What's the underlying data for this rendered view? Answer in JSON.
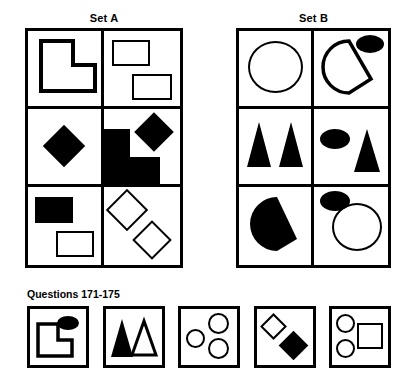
{
  "sets": [
    {
      "id": "set-a",
      "label": "Set A",
      "cells": [
        {
          "name": "cell-a1",
          "desc": "outlined L-shape",
          "shapes": [
            "l-shape-outline"
          ]
        },
        {
          "name": "cell-a2",
          "desc": "two outlined rectangles",
          "shapes": [
            "rectangle-outline",
            "rectangle-outline"
          ]
        },
        {
          "name": "cell-a3",
          "desc": "black diamond",
          "shapes": [
            "diamond-filled"
          ]
        },
        {
          "name": "cell-a4",
          "desc": "black L-shape and black diamond",
          "shapes": [
            "l-shape-filled",
            "diamond-filled"
          ]
        },
        {
          "name": "cell-a5",
          "desc": "black rectangle and outlined rectangle",
          "shapes": [
            "rectangle-filled",
            "rectangle-outline"
          ]
        },
        {
          "name": "cell-a6",
          "desc": "two outlined diamonds",
          "shapes": [
            "diamond-outline",
            "diamond-outline"
          ]
        }
      ]
    },
    {
      "id": "set-b",
      "label": "Set B",
      "cells": [
        {
          "name": "cell-b1",
          "desc": "large outlined circle",
          "shapes": [
            "circle-outline"
          ]
        },
        {
          "name": "cell-b2",
          "desc": "outlined pac-man and black ellipse",
          "shapes": [
            "pacman-outline",
            "ellipse-filled"
          ]
        },
        {
          "name": "cell-b3",
          "desc": "two black triangles",
          "shapes": [
            "triangle-filled",
            "triangle-filled"
          ]
        },
        {
          "name": "cell-b4",
          "desc": "black ellipse and black triangle",
          "shapes": [
            "ellipse-filled",
            "triangle-filled"
          ]
        },
        {
          "name": "cell-b5",
          "desc": "black pac-man",
          "shapes": [
            "pacman-filled"
          ]
        },
        {
          "name": "cell-b6",
          "desc": "black ellipse and outlined circle",
          "shapes": [
            "ellipse-filled",
            "circle-outline"
          ]
        }
      ]
    }
  ],
  "questions": {
    "label": "Questions 171-175",
    "options": [
      {
        "number": "1",
        "name": "answer-option-1",
        "desc": "outlined L-shape and black ellipse",
        "shapes": [
          "l-shape-outline",
          "ellipse-filled"
        ]
      },
      {
        "number": "2",
        "name": "answer-option-2",
        "desc": "black triangle and outlined triangle",
        "shapes": [
          "triangle-filled",
          "triangle-outline"
        ]
      },
      {
        "number": "3",
        "name": "answer-option-3",
        "desc": "three outlined circles",
        "shapes": [
          "circle-outline",
          "circle-outline",
          "circle-outline"
        ]
      },
      {
        "number": "4",
        "name": "answer-option-4",
        "desc": "outlined diamond and black diamond",
        "shapes": [
          "diamond-outline",
          "diamond-filled"
        ]
      },
      {
        "number": "5",
        "name": "answer-option-5",
        "desc": "two outlined circles and outlined square",
        "shapes": [
          "circle-outline",
          "circle-outline",
          "square-outline"
        ]
      }
    ]
  },
  "colors": {
    "ink": "#000000",
    "paper": "#ffffff"
  }
}
